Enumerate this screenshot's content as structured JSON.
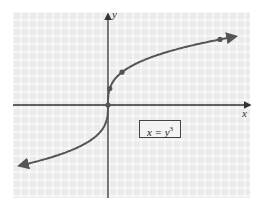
{
  "chart_data": {
    "type": "line",
    "title": "",
    "xlabel": "x",
    "ylabel": "y",
    "equation": "x = y^3",
    "equation_label": {
      "lhs": "x = y",
      "exponent": "3"
    },
    "grid": true,
    "xlim": [
      -6,
      9
    ],
    "ylim": [
      -6,
      6
    ],
    "series": [
      {
        "name": "x = y^3",
        "color": "#555555",
        "x": [
          -6,
          -1,
          -0.125,
          0,
          0.125,
          1,
          8,
          9
        ],
        "y": [
          -1.817,
          -1,
          -0.5,
          0,
          0.5,
          1,
          2,
          2.08
        ]
      }
    ],
    "highlighted_points": [
      {
        "x": 0,
        "y": 0
      },
      {
        "x": 0.125,
        "y": 0.5
      },
      {
        "x": 1,
        "y": 1
      },
      {
        "x": 8,
        "y": 2
      }
    ],
    "colors": {
      "grid": "#ffffff",
      "background": "#ebebeb",
      "axis": "#333333",
      "curve": "#555555"
    }
  }
}
